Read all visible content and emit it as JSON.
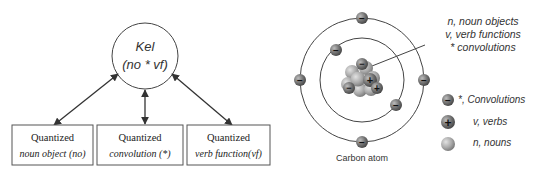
{
  "left_diagram": {
    "center_node": {
      "title": "Kel",
      "formula": "(no * vf)"
    },
    "boxes": [
      {
        "label": "Quantized",
        "sub": "noun object (no)"
      },
      {
        "label": "Quantized",
        "sub": "convolution (*)"
      },
      {
        "label": "Quantized",
        "sub": "verb function(vf)"
      }
    ]
  },
  "right_diagram": {
    "caption": "Carbon atom",
    "annotation": [
      "n, noun objects",
      "v, verb functions",
      "* convolutions"
    ],
    "legend": [
      {
        "icon": "electron-minus-icon",
        "label": "*, Convolutions"
      },
      {
        "icon": "proton-plus-icon",
        "label": "v, verbs"
      },
      {
        "icon": "neutron-ball-icon",
        "label": "n, nouns"
      }
    ]
  },
  "colors": {
    "line": "#333333",
    "particle_dark": "#5a5a5a",
    "particle_light": "#b5b5b5"
  }
}
